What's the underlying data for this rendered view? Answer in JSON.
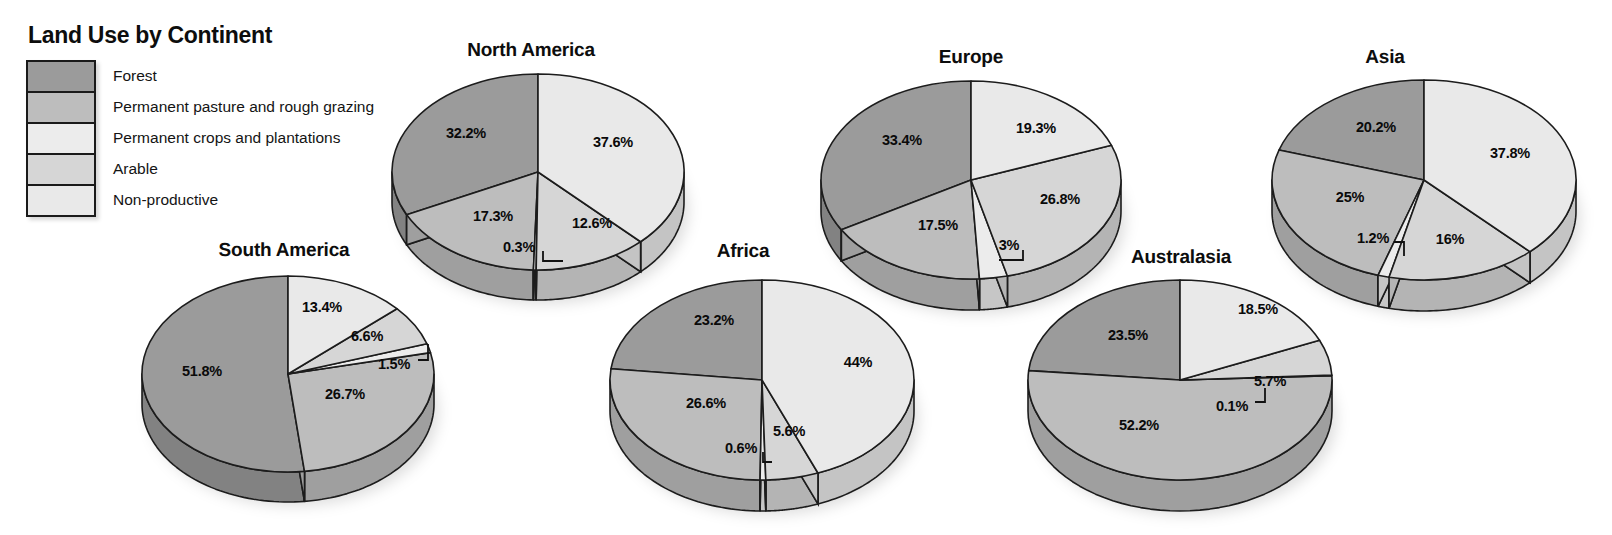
{
  "legend": {
    "title": "Land Use by Continent",
    "items": [
      {
        "label": "Forest",
        "color": "#9b9b9b"
      },
      {
        "label": "Permanent pasture and rough grazing",
        "color": "#bdbdbd"
      },
      {
        "label": "Permanent crops and plantations",
        "color": "#ececec"
      },
      {
        "label": "Arable",
        "color": "#d6d6d6"
      },
      {
        "label": "Non-productive",
        "color": "#e9e9e9"
      }
    ]
  },
  "chart_data": {
    "type": "pie",
    "title": "Land Use by Continent",
    "categories": [
      "Forest",
      "Permanent pasture and rough grazing",
      "Permanent crops and plantations",
      "Arable",
      "Non-productive"
    ],
    "colors": [
      "#9b9b9b",
      "#bdbdbd",
      "#ececec",
      "#d6d6d6",
      "#e9e9e9"
    ],
    "unit": "%",
    "legend_position": "top-left",
    "charts": [
      {
        "name": "North America",
        "cx": 538,
        "cy": 172,
        "rx": 146,
        "ry": 98,
        "depth": 30,
        "values": [
          32.2,
          17.3,
          0.3,
          12.6,
          37.6
        ],
        "labels": [
          "32.2%",
          "17.3%",
          "0.3%",
          "12.6%",
          "37.6%"
        ]
      },
      {
        "name": "South America",
        "cx": 288,
        "cy": 374,
        "rx": 146,
        "ry": 98,
        "depth": 30,
        "values": [
          51.8,
          26.7,
          1.5,
          6.6,
          13.4
        ],
        "labels": [
          "51.8%",
          "26.7%",
          "1.5%",
          "6.6%",
          "13.4%"
        ]
      },
      {
        "name": "Europe",
        "cx": 971,
        "cy": 180,
        "rx": 150,
        "ry": 99,
        "depth": 31,
        "values": [
          33.4,
          17.5,
          3,
          26.8,
          19.3
        ],
        "labels": [
          "33.4%",
          "17.5%",
          "3%",
          "26.8%",
          "19.3%"
        ]
      },
      {
        "name": "Africa",
        "cx": 762,
        "cy": 380,
        "rx": 152,
        "ry": 100,
        "depth": 31,
        "values": [
          23.2,
          26.6,
          0.6,
          5.6,
          44
        ],
        "labels": [
          "23.2%",
          "26.6%",
          "0.6%",
          "5.6%",
          "44%"
        ]
      },
      {
        "name": "Asia",
        "cx": 1424,
        "cy": 180,
        "rx": 152,
        "ry": 100,
        "depth": 31,
        "values": [
          20.2,
          25,
          1.2,
          16,
          37.8
        ],
        "labels": [
          "20.2%",
          "25%",
          "1.2%",
          "16%",
          "37.8%"
        ]
      },
      {
        "name": "Australasia",
        "cx": 1180,
        "cy": 380,
        "rx": 152,
        "ry": 100,
        "depth": 31,
        "values": [
          23.5,
          52.2,
          0.1,
          5.7,
          18.5
        ],
        "labels": [
          "23.5%",
          "52.2%",
          "0.1%",
          "5.7%",
          "18.5%"
        ]
      }
    ],
    "label_overrides": {
      "North America": [
        {
          "text": "32.2%",
          "x": 466,
          "y": 133
        },
        {
          "text": "17.3%",
          "x": 493,
          "y": 216
        },
        {
          "text": "0.3%",
          "x": 519,
          "y": 247,
          "leader": [
            [
              543,
              251
            ],
            [
              543,
              261
            ],
            [
              563,
              261
            ]
          ]
        },
        {
          "text": "12.6%",
          "x": 592,
          "y": 223
        },
        {
          "text": "37.6%",
          "x": 613,
          "y": 142
        }
      ],
      "South America": [
        {
          "text": "51.8%",
          "x": 202,
          "y": 371
        },
        {
          "text": "26.7%",
          "x": 345,
          "y": 394
        },
        {
          "text": "1.5%",
          "x": 394,
          "y": 364,
          "leader": [
            [
              418,
              360
            ],
            [
              428,
              360
            ],
            [
              428,
              344
            ]
          ]
        },
        {
          "text": "6.6%",
          "x": 367,
          "y": 336
        },
        {
          "text": "13.4%",
          "x": 322,
          "y": 307
        }
      ],
      "Europe": [
        {
          "text": "33.4%",
          "x": 902,
          "y": 140
        },
        {
          "text": "17.5%",
          "x": 938,
          "y": 225
        },
        {
          "text": "3%",
          "x": 1009,
          "y": 245,
          "leader": [
            [
              1023,
              250
            ],
            [
              1023,
              260
            ],
            [
              999,
              260
            ]
          ]
        },
        {
          "text": "26.8%",
          "x": 1060,
          "y": 199
        },
        {
          "text": "19.3%",
          "x": 1036,
          "y": 128
        }
      ],
      "Africa": [
        {
          "text": "23.2%",
          "x": 714,
          "y": 320
        },
        {
          "text": "26.6%",
          "x": 706,
          "y": 403
        },
        {
          "text": "0.6%",
          "x": 741,
          "y": 448,
          "leader": [
            [
              763,
              452
            ],
            [
              763,
              462
            ],
            [
              772,
              462
            ]
          ]
        },
        {
          "text": "5.6%",
          "x": 789,
          "y": 431
        },
        {
          "text": "44%",
          "x": 858,
          "y": 362
        }
      ],
      "Asia": [
        {
          "text": "20.2%",
          "x": 1376,
          "y": 127
        },
        {
          "text": "25%",
          "x": 1350,
          "y": 197
        },
        {
          "text": "1.2%",
          "x": 1373,
          "y": 238,
          "leader": [
            [
              1394,
              242
            ],
            [
              1404,
              242
            ],
            [
              1404,
              256
            ]
          ]
        },
        {
          "text": "16%",
          "x": 1450,
          "y": 239
        },
        {
          "text": "37.8%",
          "x": 1510,
          "y": 153
        }
      ],
      "Australasia": [
        {
          "text": "23.5%",
          "x": 1128,
          "y": 335
        },
        {
          "text": "52.2%",
          "x": 1139,
          "y": 425
        },
        {
          "text": "0.1%",
          "x": 1232,
          "y": 406,
          "leader": [
            [
              1255,
              402
            ],
            [
              1265,
              402
            ],
            [
              1265,
              388
            ]
          ]
        },
        {
          "text": "5.7%",
          "x": 1270,
          "y": 381
        },
        {
          "text": "18.5%",
          "x": 1258,
          "y": 309
        }
      ]
    }
  },
  "titles": [
    {
      "text": "North America",
      "x": 531,
      "y": 40
    },
    {
      "text": "South America",
      "x": 284,
      "y": 240
    },
    {
      "text": "Europe",
      "x": 971,
      "y": 47
    },
    {
      "text": "Africa",
      "x": 743,
      "y": 241
    },
    {
      "text": "Asia",
      "x": 1385,
      "y": 47
    },
    {
      "text": "Australasia",
      "x": 1181,
      "y": 247
    }
  ]
}
